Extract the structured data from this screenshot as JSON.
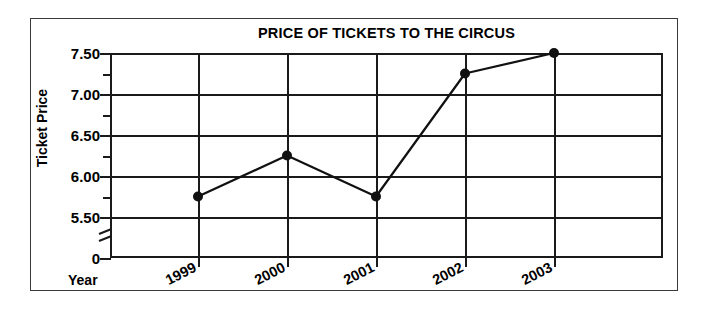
{
  "chart_data": {
    "type": "line",
    "title": "PRICE OF TICKETS TO THE CIRCUS",
    "xlabel": "Year",
    "ylabel": "Ticket Price",
    "categories": [
      "1999",
      "2000",
      "2001",
      "2002",
      "2003"
    ],
    "values": [
      5.75,
      6.25,
      5.75,
      7.25,
      7.5
    ],
    "series": [
      {
        "name": "Ticket Price",
        "values": [
          5.75,
          6.25,
          5.75,
          7.25,
          7.5
        ]
      }
    ],
    "ylim": [
      5.25,
      7.5
    ],
    "y_ticks": [
      "7.50",
      "7.00",
      "6.50",
      "6.00",
      "5.50",
      "0"
    ],
    "y_tick_values": [
      7.5,
      7.0,
      6.5,
      6.0,
      5.5,
      0
    ],
    "y_minor_ticks": [
      7.25,
      6.75,
      6.25,
      5.75
    ],
    "y_axis_break": true,
    "grid": "both",
    "legend": "none",
    "marker": "filled-circle",
    "line_color": "#111111",
    "grid_color": "#1a1a1a",
    "background": "#ffffff"
  },
  "axes": {
    "y_labels": [
      {
        "text": "7.50",
        "value": 7.5
      },
      {
        "text": "7.00",
        "value": 7.0
      },
      {
        "text": "6.50",
        "value": 6.5
      },
      {
        "text": "6.00",
        "value": 6.0
      },
      {
        "text": "5.50",
        "value": 5.5
      },
      {
        "text": "0",
        "value": 0
      }
    ],
    "x_labels": [
      {
        "text": "1999"
      },
      {
        "text": "2000"
      },
      {
        "text": "2001"
      },
      {
        "text": "2002"
      },
      {
        "text": "2003"
      }
    ]
  },
  "icons": {
    "axis_break": "axis-break-slashes"
  }
}
